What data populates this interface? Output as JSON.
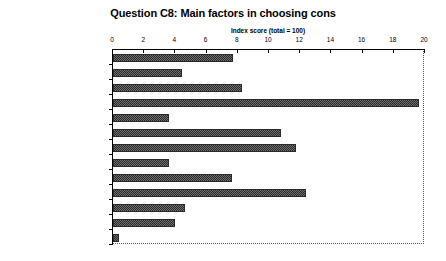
{
  "chart_data": {
    "type": "bar",
    "orientation": "horizontal",
    "title": "Question C8: Main factors in choosing cons",
    "xlabel": "Index score (total = 100)",
    "ylabel": "",
    "xlim": [
      0,
      20
    ],
    "xticks": [
      0,
      2,
      4,
      6,
      8,
      10,
      12,
      14,
      16,
      18,
      20
    ],
    "xticklabels": [
      "0",
      "2",
      "4",
      "6",
      "8",
      "10",
      "12",
      "14",
      "16",
      "18",
      "20"
    ],
    "grid": false,
    "legend": null,
    "categories": [
      "General reputation of firm",
      "Past client references",
      "Specific recommendation",
      "Understanding of problem",
      "Methodology",
      "Tailored approach",
      "Quality of proposal",
      "Quality of presentation",
      "Rapport with consultants",
      "Skills/experience of cons",
      "Impression of commitment",
      "Price",
      "Other"
    ],
    "values": [
      7.7,
      4.4,
      8.3,
      19.6,
      3.6,
      10.8,
      11.7,
      3.6,
      7.6,
      12.4,
      4.6,
      4.0,
      0.4
    ],
    "bar_color": "#6e6e6e",
    "bar_edge_color": "#2b2b2b",
    "bar_pattern": "checkerboard"
  }
}
